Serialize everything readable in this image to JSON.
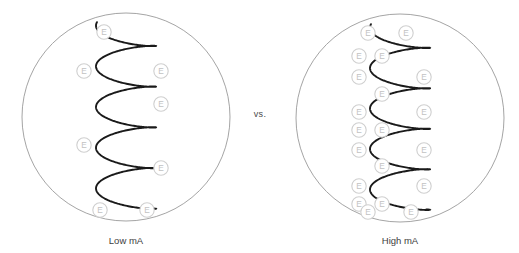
{
  "figure": {
    "title": "",
    "comparison_label": "vs.",
    "electron_glyph": "E",
    "colors": {
      "body_outline": "#9a9a9a",
      "helix_stroke": "#1a1a1a",
      "marker_outline": "#cfcfcf",
      "marker_text": "#c2c2c2",
      "caption_text": "#3d3d3d",
      "background": "#ffffff"
    }
  },
  "panels": [
    {
      "id": "low-ma",
      "caption": "Low mA",
      "body": {
        "cx": 126,
        "cy": 117,
        "r": 104
      },
      "helix": {
        "cx": 126,
        "top": 24,
        "bottom": 212,
        "loops": 4,
        "loop_rx": 30,
        "loop_ry": 13,
        "stroke_width": 1.9
      },
      "electron_count": 8,
      "electrons": [
        {
          "x": 104,
          "y": 32
        },
        {
          "x": 84,
          "y": 71
        },
        {
          "x": 161,
          "y": 71
        },
        {
          "x": 161,
          "y": 104
        },
        {
          "x": 84,
          "y": 145
        },
        {
          "x": 161,
          "y": 168
        },
        {
          "x": 100,
          "y": 210
        },
        {
          "x": 147,
          "y": 210
        }
      ]
    },
    {
      "id": "high-ma",
      "caption": "High mA",
      "body": {
        "cx": 400,
        "cy": 118,
        "r": 104
      },
      "helix": {
        "cx": 400,
        "top": 26,
        "bottom": 213,
        "loops": 4,
        "loop_rx": 30,
        "loop_ry": 13,
        "stroke_width": 1.9
      },
      "electron_count": 18,
      "electrons": [
        {
          "x": 368,
          "y": 33
        },
        {
          "x": 406,
          "y": 33
        },
        {
          "x": 359,
          "y": 56
        },
        {
          "x": 382,
          "y": 56
        },
        {
          "x": 359,
          "y": 77
        },
        {
          "x": 424,
          "y": 77
        },
        {
          "x": 382,
          "y": 94
        },
        {
          "x": 359,
          "y": 112
        },
        {
          "x": 424,
          "y": 112
        },
        {
          "x": 359,
          "y": 130
        },
        {
          "x": 382,
          "y": 130
        },
        {
          "x": 359,
          "y": 150
        },
        {
          "x": 424,
          "y": 150
        },
        {
          "x": 382,
          "y": 166
        },
        {
          "x": 359,
          "y": 186
        },
        {
          "x": 424,
          "y": 186
        },
        {
          "x": 382,
          "y": 204
        },
        {
          "x": 359,
          "y": 204
        },
        {
          "x": 368,
          "y": 212
        },
        {
          "x": 411,
          "y": 212
        }
      ]
    }
  ]
}
